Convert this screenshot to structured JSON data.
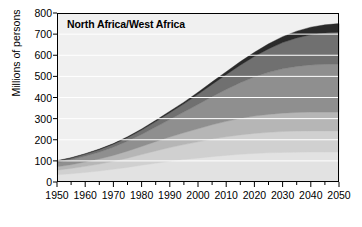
{
  "chart_data": {
    "type": "area",
    "stacked": true,
    "title": "North Africa/West Africa",
    "xlabel": "",
    "ylabel": "Millions of persons",
    "xlim": [
      1950,
      2050
    ],
    "ylim": [
      0,
      800
    ],
    "ytick_step": 100,
    "xtick_step": 10,
    "x_minor_step": 5,
    "grid": true,
    "grid_color": "#ffffff",
    "plot_background": "#f0f0f0",
    "frame_color": "#000000",
    "legend": "none",
    "x": [
      1950,
      1955,
      1960,
      1965,
      1970,
      1975,
      1980,
      1985,
      1990,
      1995,
      2000,
      2005,
      2010,
      2015,
      2020,
      2025,
      2030,
      2035,
      2040,
      2045,
      2050
    ],
    "xtick_labels": [
      "1950",
      "1960",
      "1970",
      "1980",
      "1990",
      "2000",
      "2010",
      "2020",
      "2030",
      "2040",
      "2050"
    ],
    "ytick_labels": [
      "0",
      "100",
      "200",
      "300",
      "400",
      "500",
      "600",
      "700",
      "800"
    ],
    "series": [
      {
        "name": "band-1-bottom",
        "color": "#e2e2e2",
        "values": [
          34,
          39,
          45,
          52,
          60,
          69,
          79,
          89,
          98,
          106,
          113,
          120,
          126,
          131,
          135,
          138,
          140,
          141,
          142,
          142,
          142
        ]
      },
      {
        "name": "band-2",
        "color": "#d0d0d0",
        "values": [
          22,
          25,
          29,
          33,
          38,
          44,
          51,
          58,
          65,
          71,
          77,
          83,
          88,
          92,
          95,
          97,
          99,
          100,
          100,
          100,
          100
        ]
      },
      {
        "name": "band-3",
        "color": "#b6b6b6",
        "values": [
          16,
          18,
          21,
          24,
          28,
          33,
          38,
          44,
          50,
          56,
          62,
          68,
          73,
          78,
          82,
          85,
          87,
          88,
          89,
          89,
          89
        ]
      },
      {
        "name": "band-4",
        "color": "#8f8f8f",
        "values": [
          20,
          23,
          27,
          32,
          39,
          47,
          57,
          69,
          83,
          98,
          115,
          133,
          151,
          169,
          185,
          199,
          210,
          218,
          223,
          226,
          227
        ]
      },
      {
        "name": "band-5",
        "color": "#707070",
        "values": [
          7,
          8,
          10,
          12,
          14,
          17,
          21,
          26,
          32,
          39,
          48,
          58,
          70,
          83,
          97,
          111,
          124,
          135,
          143,
          148,
          151
        ]
      },
      {
        "name": "band-6-top",
        "color": "#2a2a2a",
        "values": [
          2,
          2,
          2,
          3,
          3,
          4,
          5,
          6,
          7,
          8,
          10,
          12,
          14,
          17,
          20,
          24,
          28,
          32,
          36,
          39,
          41
        ]
      }
    ],
    "totals": [
      101,
      115,
      134,
      156,
      182,
      214,
      251,
      292,
      335,
      378,
      425,
      474,
      522,
      570,
      614,
      654,
      688,
      714,
      733,
      744,
      750
    ]
  }
}
